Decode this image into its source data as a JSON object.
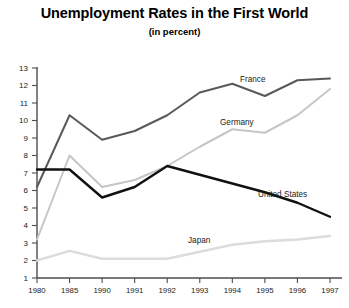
{
  "chart_data": {
    "type": "line",
    "title": "Unemployment Rates in the First World",
    "subtitle": "(in percent)",
    "xlabel": "",
    "ylabel": "",
    "ylim": [
      1,
      13
    ],
    "grid": false,
    "legend_position": "inline-labels",
    "categories": [
      "1980",
      "1985",
      "1990",
      "1991",
      "1992",
      "1993",
      "1994",
      "1995",
      "1996",
      "1997"
    ],
    "yticks": [
      "1",
      "2",
      "3",
      "4",
      "5",
      "6",
      "7",
      "8",
      "9",
      "10",
      "11",
      "12",
      "13"
    ],
    "series": [
      {
        "name": "France",
        "color": "#595959",
        "values": [
          6.2,
          10.3,
          8.9,
          9.4,
          10.3,
          11.6,
          12.1,
          11.4,
          12.3,
          12.4
        ]
      },
      {
        "name": "Germany",
        "color": "#c6c6c6",
        "values": [
          3.2,
          8.0,
          6.2,
          6.6,
          7.4,
          8.5,
          9.5,
          9.3,
          10.3,
          11.8
        ]
      },
      {
        "name": "United States",
        "color": "#111111",
        "values": [
          7.2,
          7.2,
          5.6,
          6.2,
          7.4,
          6.9,
          6.4,
          5.9,
          5.3,
          4.5
        ]
      },
      {
        "name": "Japan",
        "color": "#dcdcdc",
        "values": [
          2.0,
          2.55,
          2.1,
          2.1,
          2.1,
          2.5,
          2.9,
          3.1,
          3.2,
          3.4
        ]
      }
    ],
    "series_label_positions": [
      {
        "name": "France",
        "x": 240,
        "y": 82
      },
      {
        "name": "Germany",
        "x": 220,
        "y": 125
      },
      {
        "name": "United States",
        "x": 258,
        "y": 197
      },
      {
        "name": "Japan",
        "x": 188,
        "y": 243
      }
    ]
  }
}
